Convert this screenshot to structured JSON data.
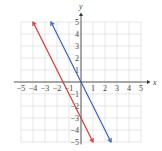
{
  "chart_data": {
    "type": "line",
    "title": "",
    "xlabel": "x",
    "ylabel": "y",
    "xlim": [
      -5,
      5
    ],
    "ylim": [
      -5,
      5
    ],
    "grid": true,
    "x_ticks": [
      -5,
      -4,
      -3,
      -2,
      -1,
      1,
      2,
      3,
      4,
      5
    ],
    "y_ticks": [
      5,
      4,
      3,
      2,
      1,
      -1,
      -2,
      -3,
      -4,
      -5
    ],
    "series": [
      {
        "name": "red line",
        "color": "#e03a3a",
        "equation": "y = -2x - 3",
        "points": [
          [
            -4,
            5
          ],
          [
            1,
            -5
          ]
        ]
      },
      {
        "name": "blue line",
        "color": "#3a64c8",
        "equation": "y = -2x",
        "points": [
          [
            -2.5,
            5
          ],
          [
            2.5,
            -5
          ]
        ]
      }
    ]
  }
}
